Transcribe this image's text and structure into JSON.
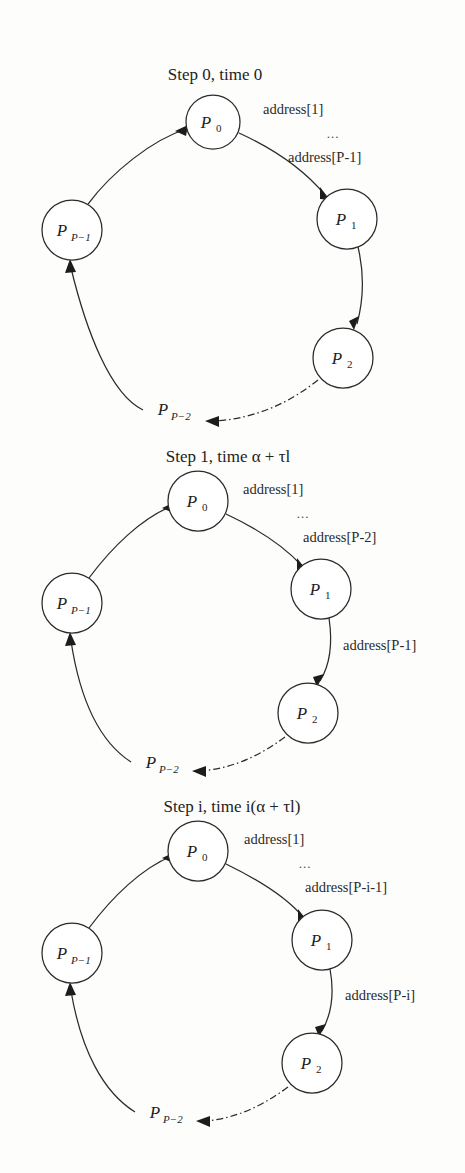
{
  "figure": {
    "kind": "ring-communication-diagram",
    "background_color": "#fdfdfc",
    "ink_color": "#2b2b2b",
    "panel_count": 3
  },
  "panels": [
    {
      "id": "step-0",
      "caption": "Step 0, time 0",
      "caption_parts": {
        "prefix": "Step 0, time 0"
      },
      "nodes": [
        {
          "id": "p0",
          "label": "P",
          "sub": "0",
          "cx": 213,
          "cy": 122,
          "r": 27
        },
        {
          "id": "p1",
          "label": "P",
          "sub": "1",
          "cx": 347,
          "cy": 219,
          "r": 30
        },
        {
          "id": "p2",
          "label": "P",
          "sub": "2",
          "cx": 343,
          "cy": 358,
          "r": 30
        },
        {
          "id": "pPm1",
          "label": "P",
          "sub": "P−1",
          "cx": 72,
          "cy": 230,
          "r": 30
        }
      ],
      "ghost_nodes": [
        {
          "id": "pPm2",
          "label": "P",
          "sub": "P−2",
          "x": 155,
          "y": 415
        }
      ],
      "edge_labels": {
        "top_right_first": "address[1]",
        "top_right_dots": "...",
        "top_right_last": "address[P-1]"
      }
    },
    {
      "id": "step-1",
      "caption": "Step 1, time α + τl",
      "caption_parts": {
        "prefix": "Step 1, time ",
        "alpha": "α",
        "plus": " + ",
        "tau_l": "τl"
      },
      "nodes": [
        {
          "id": "p0",
          "label": "P",
          "sub": "0",
          "cx": 198,
          "cy": 501,
          "r": 30
        },
        {
          "id": "p1",
          "label": "P",
          "sub": "1",
          "cx": 321,
          "cy": 589,
          "r": 30
        },
        {
          "id": "p2",
          "label": "P",
          "sub": "2",
          "cx": 308,
          "cy": 713,
          "r": 30
        },
        {
          "id": "pPm1",
          "label": "P",
          "sub": "P−1",
          "cx": 72,
          "cy": 603,
          "r": 30
        }
      ],
      "ghost_nodes": [
        {
          "id": "pPm2",
          "label": "P",
          "sub": "P−2",
          "x": 143,
          "y": 768
        }
      ],
      "edge_labels": {
        "top_right_first": "address[1]",
        "top_right_dots": "...",
        "top_right_last": "address[P-2]",
        "right_vertical": "address[P-1]"
      }
    },
    {
      "id": "step-i",
      "caption": "Step i, time i(α + τl)",
      "caption_parts": {
        "prefix": "Step ",
        "i": "i",
        "middle": ", time ",
        "expr": "i(α + τl)"
      },
      "nodes": [
        {
          "id": "p0",
          "label": "P",
          "sub": "0",
          "cx": 198,
          "cy": 851,
          "r": 30
        },
        {
          "id": "p1",
          "label": "P",
          "sub": "1",
          "cx": 322,
          "cy": 940,
          "r": 30
        },
        {
          "id": "p2",
          "label": "P",
          "sub": "2",
          "cx": 312,
          "cy": 1063,
          "r": 30
        },
        {
          "id": "pPm1",
          "label": "P",
          "sub": "P−1",
          "cx": 72,
          "cy": 953,
          "r": 30
        }
      ],
      "ghost_nodes": [
        {
          "id": "pPm2",
          "label": "P",
          "sub": "P−2",
          "x": 147,
          "y": 1118
        }
      ],
      "edge_labels": {
        "top_right_first": "address[1]",
        "top_right_dots": "...",
        "top_right_last": "address[P-i-1]",
        "right_vertical": "address[P-i]"
      }
    }
  ]
}
